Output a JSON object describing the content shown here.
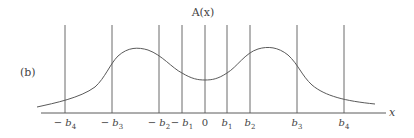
{
  "figure": {
    "panel_label": "(b)",
    "title": "A(x)",
    "x_axis_label": "x",
    "ticks": [
      {
        "id": "neg_b4",
        "sign": "− ",
        "sym": "b",
        "sub": "4",
        "px": 65
      },
      {
        "id": "neg_b3",
        "sign": "− ",
        "sym": "b",
        "sub": "3",
        "px": 112
      },
      {
        "id": "neg_b2",
        "sign": "− ",
        "sym": "b",
        "sub": "2",
        "px": 159
      },
      {
        "id": "neg_b1",
        "sign": "− ",
        "sym": "b",
        "sub": "1",
        "px": 182
      },
      {
        "id": "zero",
        "sign": "",
        "sym": "0",
        "sub": "",
        "px": 205
      },
      {
        "id": "b1",
        "sign": "",
        "sym": "b",
        "sub": "1",
        "px": 227
      },
      {
        "id": "b2",
        "sign": "",
        "sym": "b",
        "sub": "2",
        "px": 250
      },
      {
        "id": "b3",
        "sign": "",
        "sym": "b",
        "sub": "3",
        "px": 297
      },
      {
        "id": "b4",
        "sign": "",
        "sym": "b",
        "sub": "4",
        "px": 344
      }
    ],
    "curve_description": "symmetric bimodal curve with peaks between -b3 and -b2 and between b2 and b3, local minimum at 0",
    "colors": {
      "line": "#5a5a5a",
      "text": "#444444",
      "background": "#ffffff"
    }
  }
}
